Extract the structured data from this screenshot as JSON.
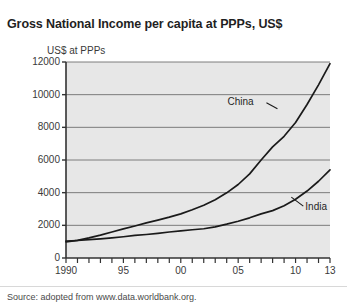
{
  "title": "Gross National Income per capita at PPPs, US$",
  "source_note": "Source: adopted from www.data.worldbank.org.",
  "axis": {
    "y_title": "US$ at PPPs",
    "y_ticks": [
      "0",
      "2000",
      "4000",
      "6000",
      "8000",
      "10000",
      "12000"
    ],
    "x_ticks": [
      "1990",
      "95",
      "00",
      "05",
      "10",
      "13"
    ]
  },
  "labels": {
    "china": "China",
    "india": "India"
  },
  "colors": {
    "plot_background": "#e7e7e7",
    "gridline": "#6f6f6f",
    "axis": "#333333",
    "series": "#1a1a1a",
    "title": "#1f1f1f"
  },
  "chart_data": {
    "type": "line",
    "title": "Gross National Income per capita at PPPs, US$",
    "subtitle": "",
    "xlabel": "",
    "ylabel": "US$ at PPPs",
    "xlim": [
      1990,
      2013
    ],
    "ylim": [
      0,
      12000
    ],
    "grid": true,
    "legend": "inline-annotations",
    "x": [
      1990,
      1991,
      1992,
      1993,
      1994,
      1995,
      1996,
      1997,
      1998,
      1999,
      2000,
      2001,
      2002,
      2003,
      2004,
      2005,
      2006,
      2007,
      2008,
      2009,
      2010,
      2011,
      2012,
      2013
    ],
    "series": [
      {
        "name": "China",
        "values": [
          980,
          1080,
          1230,
          1400,
          1590,
          1780,
          1960,
          2150,
          2320,
          2500,
          2700,
          2950,
          3230,
          3570,
          3990,
          4500,
          5150,
          6000,
          6800,
          7450,
          8300,
          9400,
          10600,
          11900
        ]
      },
      {
        "name": "India",
        "values": [
          1030,
          1070,
          1120,
          1170,
          1230,
          1300,
          1380,
          1440,
          1510,
          1590,
          1660,
          1730,
          1790,
          1910,
          2070,
          2250,
          2460,
          2700,
          2900,
          3200,
          3600,
          4100,
          4700,
          5400
        ]
      }
    ],
    "annotations": [
      {
        "text": "China",
        "x": 2007.2,
        "y": 9500
      },
      {
        "text": "India",
        "x": 2010.5,
        "y": 3050
      }
    ]
  }
}
